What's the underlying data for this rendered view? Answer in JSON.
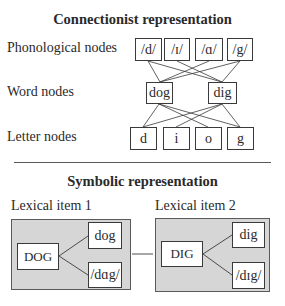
{
  "connectionist": {
    "title": "Connectionist representation",
    "rows": {
      "phonological": {
        "label": "Phonological nodes",
        "nodes": [
          "/d/",
          "/ɪ/",
          "/ɑ/",
          "/g/"
        ]
      },
      "word": {
        "label": "Word nodes",
        "nodes": [
          "dog",
          "dig"
        ]
      },
      "letter": {
        "label": "Letter nodes",
        "nodes": [
          "d",
          "i",
          "o",
          "g"
        ]
      }
    },
    "edges": {
      "phonological_to_word": [
        [
          "/d/",
          "dog"
        ],
        [
          "/d/",
          "dig"
        ],
        [
          "/ɪ/",
          "dig"
        ],
        [
          "/ɑ/",
          "dog"
        ],
        [
          "/g/",
          "dog"
        ],
        [
          "/g/",
          "dig"
        ]
      ],
      "word_to_letter": [
        [
          "dog",
          "d"
        ],
        [
          "dog",
          "o"
        ],
        [
          "dog",
          "g"
        ],
        [
          "dig",
          "d"
        ],
        [
          "dig",
          "i"
        ],
        [
          "dig",
          "g"
        ]
      ]
    }
  },
  "symbolic": {
    "title": "Symbolic representation",
    "items": [
      {
        "label": "Lexical item 1",
        "concept": "DOG",
        "orthography": "dog",
        "phonology": "/dɑg/"
      },
      {
        "label": "Lexical item 2",
        "concept": "DIG",
        "orthography": "dig",
        "phonology": "/dɪg/"
      }
    ]
  },
  "colors": {
    "lexical_item_fill": "#d6d6d6",
    "stroke": "#3a3a3a"
  }
}
